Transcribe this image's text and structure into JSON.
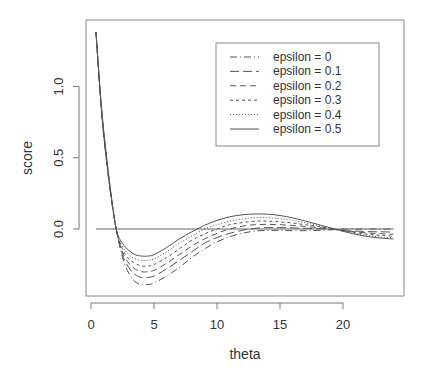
{
  "chart_data": {
    "type": "line",
    "title": "",
    "xlabel": "theta",
    "ylabel": "score",
    "xlim": [
      0,
      24.5
    ],
    "ylim": [
      -0.47,
      1.47
    ],
    "xticks": [
      0,
      5,
      10,
      15,
      20
    ],
    "xtick_labels": [
      "0",
      "5",
      "10",
      "15",
      "20"
    ],
    "yticks": [
      0.0,
      0.5,
      1.0
    ],
    "ytick_labels": [
      "0.0",
      "0.5",
      "1.0"
    ],
    "grid": false,
    "legend_position": "top-right",
    "reference_line": {
      "y": 0,
      "x_from": 0.4,
      "x_to": 24
    },
    "x": [
      0.4,
      0.7,
      1.0,
      1.5,
      2.0,
      2.5,
      3.0,
      3.5,
      4.0,
      4.5,
      5.0,
      6.0,
      7.0,
      8.0,
      9.0,
      10.0,
      11.0,
      12.0,
      13.0,
      14.0,
      15.0,
      16.0,
      17.0,
      18.0,
      19.0,
      19.5,
      20.0,
      21.0,
      22.0,
      23.0,
      24.0
    ],
    "series": [
      {
        "name": "epsilon = 0",
        "dash": "7,3,1,3",
        "values": [
          1.38,
          0.98,
          0.66,
          0.28,
          0.0,
          -0.2,
          -0.31,
          -0.37,
          -0.39,
          -0.39,
          -0.38,
          -0.33,
          -0.27,
          -0.2,
          -0.14,
          -0.09,
          -0.055,
          -0.03,
          -0.015,
          -0.01,
          -0.01,
          -0.012,
          -0.012,
          -0.01,
          -0.006,
          -0.003,
          0.0,
          0.0,
          0.0,
          0.0,
          0.0
        ]
      },
      {
        "name": "epsilon = 0.1",
        "dash": "9,4",
        "values": [
          1.38,
          0.98,
          0.67,
          0.29,
          0.0,
          -0.18,
          -0.27,
          -0.32,
          -0.34,
          -0.34,
          -0.33,
          -0.28,
          -0.22,
          -0.16,
          -0.1,
          -0.06,
          -0.03,
          -0.01,
          0.005,
          0.01,
          0.01,
          0.008,
          0.005,
          0.002,
          -0.002,
          -0.005,
          -0.01,
          -0.015,
          -0.018,
          -0.02,
          -0.022
        ]
      },
      {
        "name": "epsilon = 0.2",
        "dash": "6,4",
        "values": [
          1.38,
          0.99,
          0.68,
          0.29,
          0.0,
          -0.16,
          -0.24,
          -0.28,
          -0.3,
          -0.3,
          -0.29,
          -0.24,
          -0.18,
          -0.12,
          -0.07,
          -0.03,
          0.0,
          0.02,
          0.03,
          0.032,
          0.03,
          0.025,
          0.018,
          0.01,
          0.001,
          -0.004,
          -0.01,
          -0.02,
          -0.028,
          -0.033,
          -0.037
        ]
      },
      {
        "name": "epsilon = 0.3",
        "dash": "3,3",
        "values": [
          1.38,
          0.99,
          0.68,
          0.3,
          0.0,
          -0.14,
          -0.21,
          -0.24,
          -0.26,
          -0.26,
          -0.25,
          -0.2,
          -0.14,
          -0.08,
          -0.035,
          0.0,
          0.03,
          0.045,
          0.055,
          0.055,
          0.05,
          0.042,
          0.03,
          0.018,
          0.004,
          -0.004,
          -0.012,
          -0.026,
          -0.037,
          -0.045,
          -0.05
        ]
      },
      {
        "name": "epsilon = 0.4",
        "dash": "1,2",
        "values": [
          1.38,
          1.0,
          0.69,
          0.3,
          0.0,
          -0.12,
          -0.18,
          -0.21,
          -0.22,
          -0.22,
          -0.21,
          -0.16,
          -0.1,
          -0.05,
          0.0,
          0.03,
          0.055,
          0.07,
          0.08,
          0.08,
          0.072,
          0.06,
          0.043,
          0.025,
          0.006,
          -0.004,
          -0.014,
          -0.032,
          -0.046,
          -0.056,
          -0.062
        ]
      },
      {
        "name": "epsilon = 0.5",
        "dash": "",
        "values": [
          1.38,
          1.0,
          0.7,
          0.31,
          0.0,
          -0.1,
          -0.15,
          -0.18,
          -0.19,
          -0.19,
          -0.18,
          -0.13,
          -0.07,
          -0.02,
          0.025,
          0.06,
          0.085,
          0.1,
          0.105,
          0.104,
          0.095,
          0.078,
          0.056,
          0.032,
          0.008,
          -0.004,
          -0.016,
          -0.037,
          -0.053,
          -0.064,
          -0.07
        ]
      }
    ]
  },
  "legend": {
    "entries": [
      {
        "label": "epsilon = 0",
        "dash": "7,3,1,3"
      },
      {
        "label": "epsilon = 0.1",
        "dash": "9,4"
      },
      {
        "label": "epsilon = 0.2",
        "dash": "6,4"
      },
      {
        "label": "epsilon = 0.3",
        "dash": "3,3"
      },
      {
        "label": "epsilon = 0.4",
        "dash": "1,2"
      },
      {
        "label": "epsilon = 0.5",
        "dash": ""
      }
    ]
  },
  "colors": {
    "line": "#555555",
    "axis": "#777777",
    "text": "#333333"
  }
}
